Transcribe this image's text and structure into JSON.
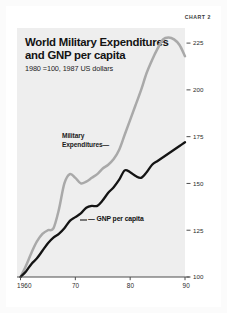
{
  "figure": {
    "chart_number_label": "CHART 2",
    "title_line1": "World Military Expenditures",
    "title_line2": "and GNP per capita",
    "subtitle": "1980 =100, 1987 US dollars",
    "colors": {
      "panel_background": "#eeeeee",
      "page_background": "#ffffff",
      "military_line": "#a9a9a9",
      "gnp_line": "#141414",
      "axis": "#4d4d4d",
      "text": "#131313"
    },
    "annotations": {
      "military_label_line1": "Military",
      "military_label_line2": "Expenditures",
      "military_label_leader": "—",
      "gnp_label": "GNP per capita",
      "gnp_label_leader": "—"
    }
  },
  "chart_data": {
    "type": "line",
    "title": "World Military Expenditures and GNP per capita",
    "subtitle": "1980 =100, 1987 US dollars",
    "xlabel": "",
    "ylabel": "",
    "xlim": [
      1960,
      1990
    ],
    "ylim": [
      100,
      232
    ],
    "grid": false,
    "legend_position": "inline-annotations",
    "y_axis_side": "right",
    "xticks": [
      1960,
      1970,
      1980,
      1990
    ],
    "xtick_labels": [
      "1960",
      "70",
      "80",
      "90"
    ],
    "yticks": [
      100,
      125,
      150,
      175,
      200,
      225
    ],
    "ytick_labels": [
      "100",
      "125",
      "150",
      "175",
      "200",
      "225"
    ],
    "x": [
      1960,
      1961,
      1962,
      1963,
      1964,
      1965,
      1966,
      1967,
      1968,
      1969,
      1970,
      1971,
      1972,
      1973,
      1974,
      1975,
      1976,
      1977,
      1978,
      1979,
      1980,
      1981,
      1982,
      1983,
      1984,
      1985,
      1986,
      1987,
      1988,
      1989,
      1990
    ],
    "series": [
      {
        "name": "Military Expenditures",
        "color": "#a9a9a9",
        "values": [
          100,
          106,
          113,
          119,
          123,
          125,
          126,
          136,
          150,
          155,
          153,
          150,
          151,
          153,
          155,
          158,
          160,
          163,
          168,
          176,
          184,
          192,
          200,
          209,
          216,
          222,
          227,
          228,
          227,
          224,
          218
        ]
      },
      {
        "name": "GNP per capita",
        "color": "#141414",
        "values": [
          100,
          103,
          107,
          110,
          114,
          118,
          121,
          123,
          126,
          130,
          132,
          134,
          137,
          138,
          138,
          141,
          145,
          148,
          152,
          157,
          156,
          154,
          153,
          156,
          160,
          162,
          164,
          166,
          168,
          170,
          172
        ]
      }
    ]
  }
}
